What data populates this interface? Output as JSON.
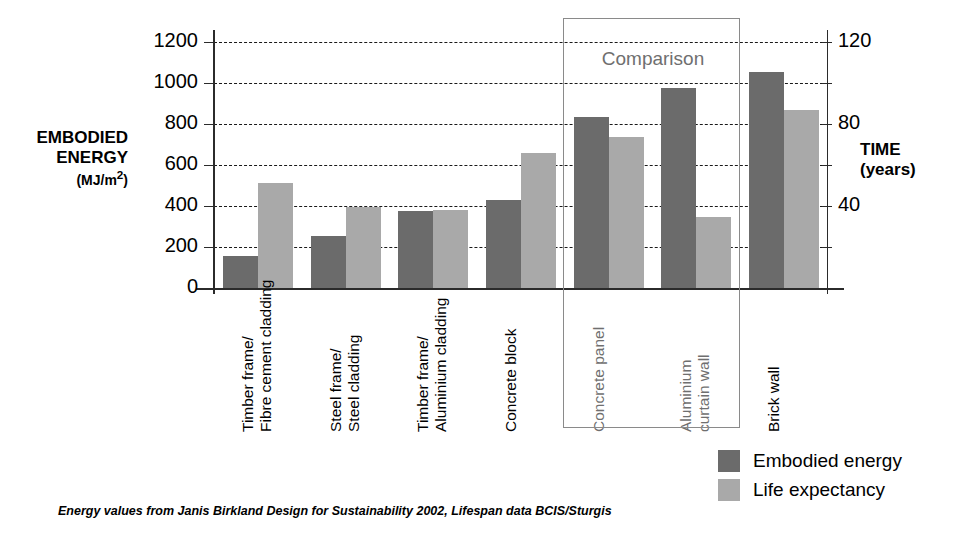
{
  "chart_data": {
    "type": "bar",
    "title": "",
    "categories": [
      "Timber frame/\nFibre cement cladding",
      "Steel frame/\nSteel cladding",
      "Timber frame/\nAluminium cladding",
      "Concrete block",
      "Concrete panel",
      "Aluminium\ncurtain wall",
      "Brick wall"
    ],
    "category_lines": [
      [
        "Timber frame/",
        "Fibre cement cladding"
      ],
      [
        "Steel frame/",
        "Steel cladding"
      ],
      [
        "Timber frame/",
        "Aluminium cladding"
      ],
      [
        "Concrete block",
        ""
      ],
      [
        "Concrete panel",
        ""
      ],
      [
        "Aluminium",
        "curtain wall"
      ],
      [
        "Brick wall",
        ""
      ]
    ],
    "series": [
      {
        "name": "Embodied energy",
        "axis": "left",
        "color": "#6b6b6b",
        "values": [
          155,
          255,
          375,
          430,
          835,
          975,
          1055
        ]
      },
      {
        "name": "Life expectancy",
        "axis": "right",
        "color": "#a9a9a9",
        "values": [
          510,
          395,
          380,
          660,
          735,
          345,
          870
        ]
      }
    ],
    "xlabel": "",
    "ylabel": "EMBODIED ENERGY (MJ/m2)",
    "ylabel_right": "TIME (years)",
    "ylim": [
      0,
      1200
    ],
    "ylim_right": [
      0,
      120
    ],
    "yticks_left": [
      0,
      200,
      400,
      600,
      800,
      1000,
      1200
    ],
    "yticks_left_labels": [
      "0",
      "200",
      "400",
      "600",
      "800",
      "1000",
      "1200"
    ],
    "yticks_right": [
      0,
      20,
      40,
      60,
      80,
      100,
      120
    ],
    "yticks_right_labels": [
      "",
      "",
      "40",
      "",
      "80",
      "",
      "120"
    ],
    "grid": true,
    "grid_style": "dashed-horizontal",
    "legend_position": "bottom-right",
    "annotations": [
      {
        "name": "comparison-box",
        "label": "Comparison",
        "covers": [
          "Concrete panel",
          "Aluminium curtain wall"
        ]
      }
    ]
  },
  "axis": {
    "left_title_line1": "EMBODIED",
    "left_title_line2": "ENERGY",
    "left_unit": "(MJ/m",
    "left_unit_sup": "2",
    "left_unit_close": ")",
    "right_title_line1": "TIME",
    "right_title_line2": "(years)"
  },
  "legend": {
    "items": [
      {
        "label": "Embodied energy",
        "color": "#6b6b6b"
      },
      {
        "label": "Life expectancy",
        "color": "#a9a9a9"
      }
    ]
  },
  "comparison": {
    "label": "Comparison",
    "border_color": "#8a8a8a"
  },
  "footnote": {
    "text": "Energy values from Janis Birkland Design for Sustainability 2002, Lifespan data BCIS/Sturgis"
  },
  "colors": {
    "embodied_energy": "#6b6b6b",
    "life_expectancy": "#a9a9a9",
    "axis": "#2b2b2b",
    "grid": "#1a1a1a",
    "comparison_border": "#8a8a8a",
    "comparison_text": "#6f6f6f",
    "background": "#ffffff"
  }
}
